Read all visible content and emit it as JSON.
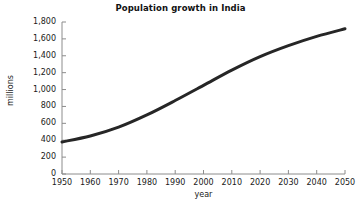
{
  "chart_data": {
    "type": "line",
    "title": "Population growth in India",
    "xlabel": "year",
    "ylabel": "millions",
    "xlim": [
      1950,
      2050
    ],
    "ylim": [
      0,
      1800
    ],
    "grid": false,
    "legend": null,
    "x_ticks": [
      "1950",
      "1960",
      "1970",
      "1980",
      "1990",
      "2000",
      "2010",
      "2020",
      "2030",
      "2040",
      "2050"
    ],
    "y_ticks": [
      "0",
      "200",
      "400",
      "600",
      "800",
      "1,000",
      "1,200",
      "1,400",
      "1,600",
      "1,800"
    ],
    "x": [
      1950,
      1960,
      1970,
      1980,
      1990,
      2000,
      2010,
      2020,
      2030,
      2040,
      2050
    ],
    "values": [
      380,
      450,
      555,
      700,
      870,
      1050,
      1230,
      1390,
      1520,
      1630,
      1720
    ],
    "series": [
      {
        "name": "Population of India",
        "color": "#262626",
        "values": [
          380,
          450,
          555,
          700,
          870,
          1050,
          1230,
          1390,
          1520,
          1630,
          1720
        ]
      }
    ],
    "line_color": "#262626",
    "line_width": 3,
    "axis_color": "#8c8c8c",
    "background": "#ffffff"
  }
}
